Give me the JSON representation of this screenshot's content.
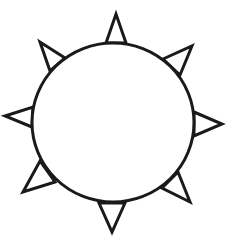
{
  "figure": {
    "subject": "sun",
    "stroke_color": "#1a1a1a",
    "fill_color": "#ffffff",
    "background": "#ffffff",
    "body": {
      "shape": "circle",
      "cx": 113,
      "cy": 122.5,
      "rx": 81,
      "ry": 79.5
    },
    "rays": [
      {
        "name": "ray-top",
        "points": "106,43 116,14 126,43"
      },
      {
        "name": "ray-top-right",
        "points": "163,59 192,46 180,75"
      },
      {
        "name": "ray-right",
        "points": "194,112 222,124 194,136"
      },
      {
        "name": "ray-bottom-right",
        "points": "178,172 190,202 162,188"
      },
      {
        "name": "ray-bottom",
        "points": "125,203 112,232 99,203"
      },
      {
        "name": "ray-bottom-left",
        "points": "55,182 23,192 40,161"
      },
      {
        "name": "ray-left",
        "points": "32,127 5,116 33,107"
      },
      {
        "name": "ray-top-left",
        "points": "50,71 40,42 65,58"
      }
    ]
  }
}
